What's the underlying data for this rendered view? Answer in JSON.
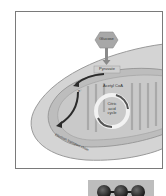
{
  "diagram": {
    "labels": {
      "glucose": "Glucose",
      "pyruvate": "Pyruvate",
      "acetyl_coa": "Acetyl CoA",
      "citric_acid_cycle": "Citric\nacid\ncycle",
      "citric_line1": "Citric",
      "citric_line2": "acid",
      "citric_line3": "cycle",
      "electron": "e⁻",
      "electron_transport_chain": "Electron transport chain"
    },
    "colors": {
      "cell_fill": "#d4d4d4",
      "cell_stroke": "#9a9a9a",
      "mito_outer": "#bdbdbd",
      "mito_inner": "#c9c9c9",
      "glucose_fill": "#a8a8a8",
      "arrow": "#2b2b2b",
      "cycle_ring": "#f2f2f2"
    }
  },
  "thumbnail": {
    "alt": "Molecule model thumbnail",
    "atoms": 3,
    "background": "#bdbdbd",
    "atom_color": "#1e1e1e"
  }
}
